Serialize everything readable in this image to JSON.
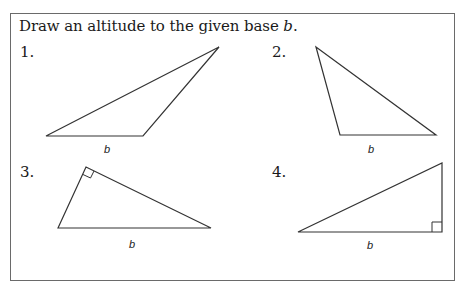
{
  "instruction": {
    "text": "Draw an altitude to the given base ",
    "variable": "b",
    "end": "."
  },
  "problems": [
    {
      "number": "1.",
      "base_label": "b",
      "vertices": [
        [
          46,
          136
        ],
        [
          143,
          136
        ],
        [
          219,
          47
        ]
      ],
      "right_angle": false
    },
    {
      "number": "2.",
      "base_label": "b",
      "vertices": [
        [
          316,
          47
        ],
        [
          340,
          135
        ],
        [
          436,
          135
        ]
      ],
      "right_angle": false
    },
    {
      "number": "3.",
      "base_label": "b",
      "vertices": [
        [
          58,
          228
        ],
        [
          86,
          167
        ],
        [
          211,
          228
        ]
      ],
      "right_angle": true,
      "right_angle_at": [
        86,
        167
      ]
    },
    {
      "number": "4.",
      "base_label": "b",
      "vertices": [
        [
          298,
          232
        ],
        [
          442,
          232
        ],
        [
          442,
          163
        ]
      ],
      "right_angle": true,
      "right_angle_at": [
        442,
        232
      ]
    }
  ],
  "colors": {
    "line": "#333333",
    "border": "#6a6a6a"
  }
}
